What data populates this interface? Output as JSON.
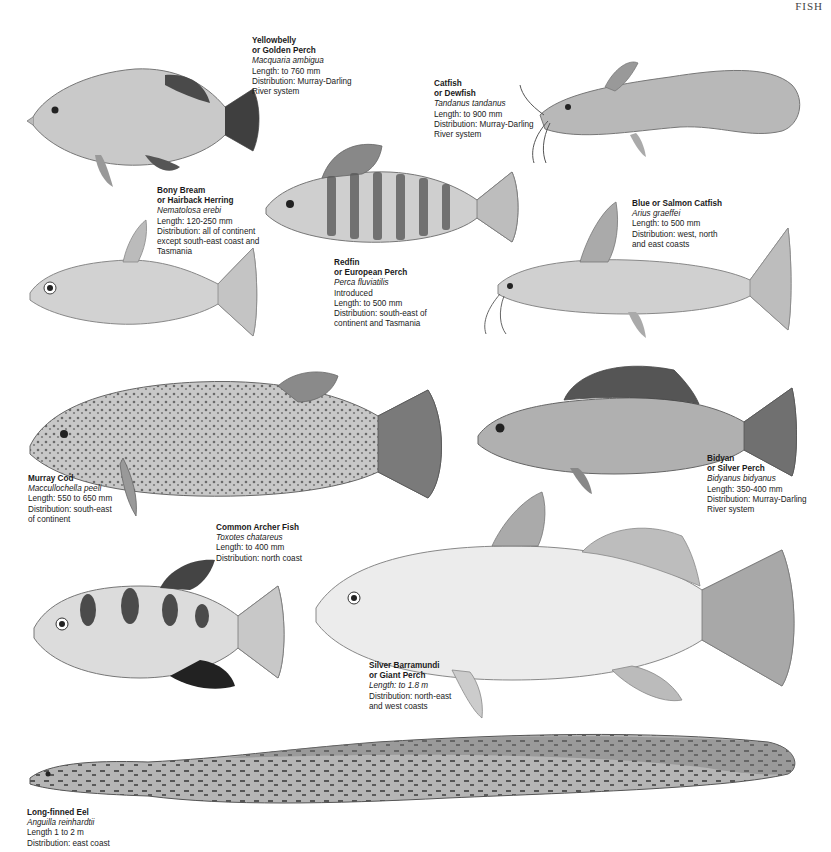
{
  "page": {
    "header": "FISH"
  },
  "species": [
    {
      "id": "yellowbelly",
      "name_lines": [
        "Yellowbelly",
        "or Golden Perch"
      ],
      "scientific": "Macquaria ambigua",
      "length": "Length: to 760 mm",
      "distribution_lines": [
        "Distribution: Murray-Darling",
        "River system"
      ]
    },
    {
      "id": "catfish",
      "name_lines": [
        "Catfish",
        "or Dewfish"
      ],
      "scientific": "Tandanus tandanus",
      "length": "Length: to 900 mm",
      "distribution_lines": [
        "Distribution: Murray-Darling",
        "River system"
      ]
    },
    {
      "id": "bony-bream",
      "name_lines": [
        "Bony Bream",
        "or Hairback Herring"
      ],
      "scientific": "Nematolosa erebi",
      "length": "Length: 120-250 mm",
      "distribution_lines": [
        "Distribution: all of continent",
        "except south-east coast and",
        "Tasmania"
      ]
    },
    {
      "id": "redfin",
      "name_lines": [
        "Redfin",
        "or European Perch"
      ],
      "scientific": "Perca fluviatilis",
      "extra": "Introduced",
      "length": "Length: to 500 mm",
      "distribution_lines": [
        "Distribution: south-east of",
        "continent and Tasmania"
      ]
    },
    {
      "id": "blue-catfish",
      "name_lines": [
        "Blue or Salmon Catfish"
      ],
      "scientific": "Arius graeffei",
      "length": "Length: to 500 mm",
      "distribution_lines": [
        "Distribution: west, north",
        "and east coasts"
      ]
    },
    {
      "id": "murray-cod",
      "name_lines": [
        "Murray Cod"
      ],
      "scientific": "Maccullochella peeli",
      "length": "Length: 550 to 650 mm",
      "distribution_lines": [
        "Distribution: south-east",
        "of continent"
      ]
    },
    {
      "id": "bidyan",
      "name_lines": [
        "Bidyan",
        "or Silver Perch"
      ],
      "scientific": "Bidyanus bidyanus",
      "length": "Length: 350-400 mm",
      "distribution_lines": [
        "Distribution: Murray-Darling",
        "River system"
      ]
    },
    {
      "id": "archer-fish",
      "name_lines": [
        "Common Archer Fish"
      ],
      "scientific": "Toxotes chatareus",
      "length": "Length: to 400 mm",
      "distribution_lines": [
        "Distribution: north coast"
      ]
    },
    {
      "id": "barramundi",
      "name_lines": [
        "Silver Barramundi",
        "or Giant Perch"
      ],
      "scientific": "Length: to 1.8 m",
      "length": "",
      "distribution_lines": [
        "Distribution: north-east",
        "and west coasts"
      ]
    },
    {
      "id": "eel",
      "name_lines": [
        "Long-finned Eel"
      ],
      "scientific": "Anguilla reinhardtii",
      "length": "Length 1 to 2 m",
      "distribution_lines": [
        "Distribution: east coast"
      ]
    }
  ],
  "colors": {
    "ink": "#1a1a1a",
    "fish_light": "#d6d6d6",
    "fish_mid": "#a8a8a8",
    "fish_dark": "#555555"
  }
}
